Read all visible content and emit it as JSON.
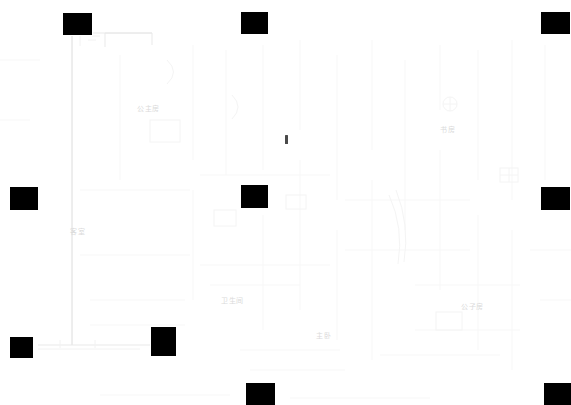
{
  "canvas": {
    "width": 571,
    "height": 405,
    "background": "#ffffff"
  },
  "drawing": {
    "type": "architectural-floor-plan",
    "line_color": "#ececec",
    "label_color": "#dadada",
    "marker_color": "#000000"
  },
  "room_labels": [
    {
      "name": "room-label-princess-room",
      "text": "公主房",
      "x": 137,
      "y": 105
    },
    {
      "name": "room-label-study",
      "text": "书房",
      "x": 440,
      "y": 126
    },
    {
      "name": "room-label-guest-room",
      "text": "客室",
      "x": 70,
      "y": 228
    },
    {
      "name": "room-label-bathroom",
      "text": "卫生间",
      "x": 221,
      "y": 297
    },
    {
      "name": "room-label-master-bedroom",
      "text": "主卧",
      "x": 316,
      "y": 332
    },
    {
      "name": "room-label-prince-room",
      "text": "公子房",
      "x": 461,
      "y": 303
    }
  ],
  "markers": [
    {
      "name": "marker-top-left",
      "x": 63,
      "y": 13,
      "w": 29,
      "h": 22
    },
    {
      "name": "marker-top-center",
      "x": 241,
      "y": 12,
      "w": 27,
      "h": 22
    },
    {
      "name": "marker-top-right",
      "x": 541,
      "y": 12,
      "w": 29,
      "h": 22
    },
    {
      "name": "marker-left-middle",
      "x": 10,
      "y": 187,
      "w": 28,
      "h": 23
    },
    {
      "name": "marker-center-middle",
      "x": 241,
      "y": 185,
      "w": 27,
      "h": 23
    },
    {
      "name": "marker-right-middle",
      "x": 541,
      "y": 187,
      "w": 29,
      "h": 23
    },
    {
      "name": "marker-bottom-left",
      "x": 10,
      "y": 337,
      "w": 23,
      "h": 21
    },
    {
      "name": "marker-bottom-left-tall",
      "x": 151,
      "y": 327,
      "w": 25,
      "h": 29
    },
    {
      "name": "marker-bottom-center",
      "x": 246,
      "y": 383,
      "w": 29,
      "h": 22
    },
    {
      "name": "marker-bottom-right",
      "x": 544,
      "y": 383,
      "w": 27,
      "h": 22
    }
  ],
  "plan_ticks": [
    {
      "name": "plan-pointer-tick",
      "x": 285,
      "y": 135,
      "w": 3,
      "h": 9
    }
  ]
}
